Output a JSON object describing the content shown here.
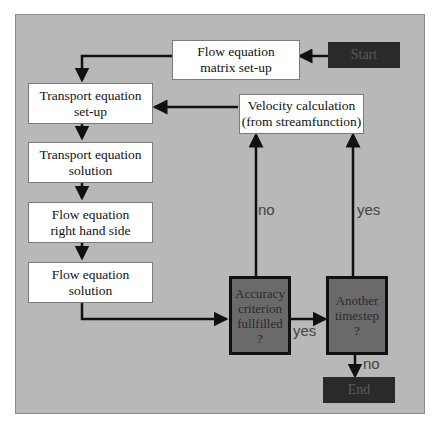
{
  "diagram": {
    "nodes": {
      "start": "Start",
      "flow_matrix": "Flow equation\nmatrix set-up",
      "transport_setup": "Transport equation\nset-up",
      "velocity": "Velocity calculation\n(from streamfunction)",
      "transport_solution": "Transport equation\nsolution",
      "flow_rhs": "Flow equation\nright hand side",
      "flow_solution": "Flow equation\nsolution",
      "accuracy": "Accuracy\ncriterion\nfullfilled\n?",
      "another": "Another\ntimestep\n?",
      "end": "End"
    },
    "edge_labels": {
      "accuracy_no": "no",
      "accuracy_yes": "yes",
      "another_yes": "yes",
      "another_no": "no"
    }
  }
}
